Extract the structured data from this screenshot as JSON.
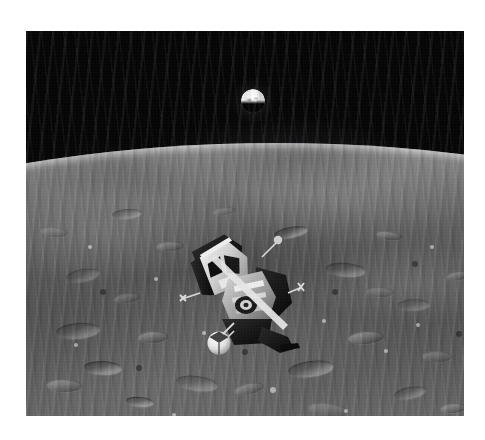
{
  "document": {
    "type": "photograph",
    "medium": "black-and-white photographic print on white paper margin",
    "title": "Lunar module ascent stage in orbit above the Moon with Earth on the horizon",
    "orientation": "landscape"
  },
  "canvas": {
    "width": 485,
    "height": 440,
    "background_color": "#ffffff"
  },
  "photo": {
    "x": 26,
    "y": 31,
    "width": 438,
    "height": 385,
    "border_color": "#ffffff",
    "sky_color": "#040405",
    "surface_light_color": "#cdcdcd",
    "surface_mid_color": "#7d7d7d",
    "surface_dark_color": "#4e4e4e",
    "highlight_color": "#f2f2f2"
  },
  "subjects": {
    "earth": {
      "label": "Earth",
      "shape": "half-lit disc above the lunar horizon",
      "center_x": 227,
      "center_y": 70,
      "diameter": 24,
      "brightness": "very bright white",
      "phase": "gibbous, terminator across the lower half"
    },
    "horizon": {
      "label": "Lunar horizon",
      "apex_x": 175,
      "apex_y": 112,
      "left_edge_y": 124,
      "right_edge_y": 150,
      "curvature": "shallow convex limb"
    },
    "lunar_module": {
      "label": "Apollo lunar module ascent stage",
      "x": 150,
      "y": 196,
      "width": 130,
      "height": 132,
      "attitude": "tilted, crew cabin toward upper left",
      "features": [
        "crew cabin with two triangular windows",
        "docking target and rendezvous radar antenna",
        "ascent engine cover",
        "reaction control thruster quads",
        "gold and black thermal blanket panels",
        "white spherical propellant tank",
        "radar dish and antenna booms"
      ]
    },
    "sky": {
      "label": "Black lunar sky",
      "stars_visible": "none"
    }
  },
  "terrain": {
    "description": "Cratered mare and highland terrain sweeping from the horizon to the bottom of the frame",
    "craters": [
      {
        "x": 40,
        "y": 238,
        "w": 34,
        "h": 13,
        "style": "dark"
      },
      {
        "x": 88,
        "y": 262,
        "w": 26,
        "h": 10,
        "style": "bright"
      },
      {
        "x": 30,
        "y": 292,
        "w": 44,
        "h": 16,
        "style": "dark"
      },
      {
        "x": 112,
        "y": 300,
        "w": 30,
        "h": 12,
        "style": "bright"
      },
      {
        "x": 58,
        "y": 330,
        "w": 38,
        "h": 14,
        "style": "dark"
      },
      {
        "x": 14,
        "y": 196,
        "w": 28,
        "h": 10,
        "style": "bright"
      },
      {
        "x": 150,
        "y": 345,
        "w": 42,
        "h": 15,
        "style": "dark"
      },
      {
        "x": 208,
        "y": 352,
        "w": 30,
        "h": 11,
        "style": "bright"
      },
      {
        "x": 262,
        "y": 330,
        "w": 46,
        "h": 16,
        "style": "dark"
      },
      {
        "x": 322,
        "y": 300,
        "w": 36,
        "h": 13,
        "style": "bright"
      },
      {
        "x": 372,
        "y": 268,
        "w": 32,
        "h": 12,
        "style": "dark"
      },
      {
        "x": 396,
        "y": 320,
        "w": 30,
        "h": 11,
        "style": "bright"
      },
      {
        "x": 300,
        "y": 232,
        "w": 40,
        "h": 14,
        "style": "dark"
      },
      {
        "x": 350,
        "y": 200,
        "w": 26,
        "h": 9,
        "style": "bright"
      },
      {
        "x": 248,
        "y": 196,
        "w": 34,
        "h": 11,
        "style": "dark"
      },
      {
        "x": 186,
        "y": 176,
        "w": 24,
        "h": 8,
        "style": "bright"
      },
      {
        "x": 86,
        "y": 178,
        "w": 30,
        "h": 10,
        "style": "dark"
      },
      {
        "x": 130,
        "y": 210,
        "w": 28,
        "h": 10,
        "style": "bright"
      },
      {
        "x": 20,
        "y": 348,
        "w": 36,
        "h": 13,
        "style": "bright"
      },
      {
        "x": 100,
        "y": 366,
        "w": 28,
        "h": 10,
        "style": "dark"
      },
      {
        "x": 282,
        "y": 372,
        "w": 40,
        "h": 14,
        "style": "bright"
      },
      {
        "x": 368,
        "y": 356,
        "w": 32,
        "h": 12,
        "style": "dark"
      },
      {
        "x": 420,
        "y": 240,
        "w": 24,
        "h": 9,
        "style": "bright"
      },
      {
        "x": 414,
        "y": 372,
        "w": 26,
        "h": 10,
        "style": "bright"
      },
      {
        "x": 196,
        "y": 252,
        "w": 22,
        "h": 8,
        "style": "dark"
      },
      {
        "x": 340,
        "y": 256,
        "w": 28,
        "h": 10,
        "style": "bright"
      }
    ],
    "specks": [
      {
        "x": 62,
        "y": 214,
        "r": 2
      },
      {
        "x": 128,
        "y": 246,
        "r": 2
      },
      {
        "x": 176,
        "y": 300,
        "r": 2
      },
      {
        "x": 232,
        "y": 268,
        "r": 2
      },
      {
        "x": 296,
        "y": 288,
        "r": 2
      },
      {
        "x": 358,
        "y": 318,
        "r": 2
      },
      {
        "x": 404,
        "y": 214,
        "r": 2
      },
      {
        "x": 48,
        "y": 312,
        "r": 2
      },
      {
        "x": 244,
        "y": 356,
        "r": 3
      },
      {
        "x": 146,
        "y": 382,
        "r": 2
      },
      {
        "x": 318,
        "y": 378,
        "r": 2
      },
      {
        "x": 390,
        "y": 292,
        "r": 2
      }
    ],
    "darkspecks": [
      {
        "x": 74,
        "y": 258,
        "r": 3
      },
      {
        "x": 168,
        "y": 228,
        "r": 3
      },
      {
        "x": 216,
        "y": 318,
        "r": 3
      },
      {
        "x": 306,
        "y": 258,
        "r": 3
      },
      {
        "x": 386,
        "y": 230,
        "r": 3
      },
      {
        "x": 110,
        "y": 334,
        "r": 3
      },
      {
        "x": 264,
        "y": 392,
        "r": 3
      },
      {
        "x": 430,
        "y": 300,
        "r": 3
      }
    ]
  }
}
